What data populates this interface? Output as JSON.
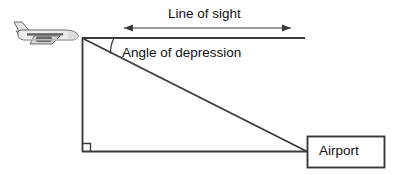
{
  "diagram": {
    "title_text": "Line of sight",
    "angle_text": "Angle of depression",
    "airport_text": "Airport",
    "colors": {
      "line": "#3a3a3a",
      "text": "#111111",
      "background": "#ffffff",
      "plane_body": "#e8e8e8",
      "plane_outline": "#555555",
      "plane_shade": "#b9b9b9",
      "plane_window_strip": "#4a4a4a"
    },
    "geometry": {
      "apex_x": 82,
      "apex_y": 38,
      "horizontal_end_x": 305,
      "ground_y": 152,
      "airport_corner_x": 307,
      "right_angle_marker_size": 8,
      "measure_arrow_y": 28,
      "measure_arrow_start_x": 124,
      "measure_arrow_end_x": 291,
      "airport_box": {
        "x": 307,
        "y": 136,
        "width": 78,
        "height": 32
      },
      "angle_arc_radius": 32
    },
    "icons": {
      "airplane": "airplane-icon",
      "left_arrowhead": "arrow-left-icon",
      "right_arrowhead": "arrow-right-icon",
      "right_angle": "right-angle-marker-icon"
    }
  }
}
